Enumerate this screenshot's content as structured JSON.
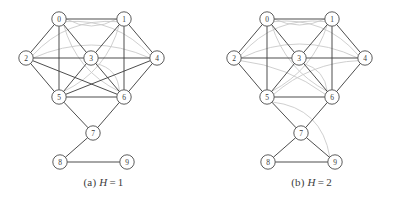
{
  "figure": {
    "panels": [
      {
        "id": "a",
        "caption_tag": "(a)",
        "caption_var": "H",
        "caption_eq": "=",
        "caption_value": "1",
        "nodes": [
          {
            "id": "0",
            "label": "0",
            "x": 59,
            "y": 19
          },
          {
            "id": "1",
            "label": "1",
            "x": 124,
            "y": 19
          },
          {
            "id": "2",
            "label": "2",
            "x": 26,
            "y": 58
          },
          {
            "id": "3",
            "label": "3",
            "x": 91,
            "y": 58
          },
          {
            "id": "4",
            "label": "4",
            "x": 157,
            "y": 58
          },
          {
            "id": "5",
            "label": "5",
            "x": 59,
            "y": 97
          },
          {
            "id": "6",
            "label": "6",
            "x": 124,
            "y": 97
          },
          {
            "id": "7",
            "label": "7",
            "x": 93,
            "y": 133
          },
          {
            "id": "8",
            "label": "8",
            "x": 60,
            "y": 162
          },
          {
            "id": "9",
            "label": "9",
            "x": 127,
            "y": 162
          }
        ],
        "node_radius": 7.2,
        "edges_dark": [
          {
            "from": "0",
            "to": "1"
          },
          {
            "from": "0",
            "to": "2"
          },
          {
            "from": "0",
            "to": "3"
          },
          {
            "from": "0",
            "to": "5"
          },
          {
            "from": "1",
            "to": "3"
          },
          {
            "from": "1",
            "to": "4"
          },
          {
            "from": "1",
            "to": "6"
          },
          {
            "from": "2",
            "to": "3"
          },
          {
            "from": "2",
            "to": "5"
          },
          {
            "from": "2",
            "to": "6"
          },
          {
            "from": "3",
            "to": "4"
          },
          {
            "from": "3",
            "to": "5"
          },
          {
            "from": "3",
            "to": "6"
          },
          {
            "from": "4",
            "to": "5"
          },
          {
            "from": "4",
            "to": "6"
          },
          {
            "from": "5",
            "to": "6"
          },
          {
            "from": "5",
            "to": "7"
          },
          {
            "from": "6",
            "to": "7"
          },
          {
            "from": "7",
            "to": "8"
          },
          {
            "from": "8",
            "to": "9"
          }
        ],
        "edges_light": [
          {
            "from": "0",
            "to": "4",
            "bow": -22
          },
          {
            "from": "0",
            "to": "6",
            "bow": 20
          },
          {
            "from": "1",
            "to": "2",
            "bow": 22
          },
          {
            "from": "1",
            "to": "5",
            "bow": -20
          },
          {
            "from": "2",
            "to": "4",
            "bow": -26
          },
          {
            "from": "3",
            "to": "6",
            "bow": -14
          },
          {
            "from": "0",
            "to": "1",
            "bow": 14
          }
        ]
      },
      {
        "id": "b",
        "caption_tag": "(b)",
        "caption_var": "H",
        "caption_eq": "=",
        "caption_value": "2",
        "nodes": [
          {
            "id": "0",
            "label": "0",
            "x": 59,
            "y": 19
          },
          {
            "id": "1",
            "label": "1",
            "x": 124,
            "y": 19
          },
          {
            "id": "2",
            "label": "2",
            "x": 26,
            "y": 58
          },
          {
            "id": "3",
            "label": "3",
            "x": 91,
            "y": 58
          },
          {
            "id": "4",
            "label": "4",
            "x": 157,
            "y": 58
          },
          {
            "id": "5",
            "label": "5",
            "x": 59,
            "y": 97
          },
          {
            "id": "6",
            "label": "6",
            "x": 124,
            "y": 97
          },
          {
            "id": "7",
            "label": "7",
            "x": 93,
            "y": 133
          },
          {
            "id": "8",
            "label": "8",
            "x": 60,
            "y": 162
          },
          {
            "id": "9",
            "label": "9",
            "x": 127,
            "y": 162
          }
        ],
        "node_radius": 7.2,
        "edges_dark": [
          {
            "from": "0",
            "to": "1"
          },
          {
            "from": "0",
            "to": "2"
          },
          {
            "from": "0",
            "to": "3"
          },
          {
            "from": "0",
            "to": "5"
          },
          {
            "from": "1",
            "to": "3"
          },
          {
            "from": "1",
            "to": "4"
          },
          {
            "from": "1",
            "to": "6"
          },
          {
            "from": "2",
            "to": "3"
          },
          {
            "from": "2",
            "to": "5"
          },
          {
            "from": "3",
            "to": "4"
          },
          {
            "from": "3",
            "to": "5"
          },
          {
            "from": "3",
            "to": "6"
          },
          {
            "from": "4",
            "to": "6"
          },
          {
            "from": "5",
            "to": "6"
          },
          {
            "from": "5",
            "to": "7"
          },
          {
            "from": "6",
            "to": "7"
          },
          {
            "from": "7",
            "to": "8"
          },
          {
            "from": "7",
            "to": "9"
          },
          {
            "from": "8",
            "to": "9"
          }
        ],
        "edges_light": [
          {
            "from": "0",
            "to": "4",
            "bow": -24
          },
          {
            "from": "0",
            "to": "6",
            "bow": 18
          },
          {
            "from": "1",
            "to": "2",
            "bow": 24
          },
          {
            "from": "1",
            "to": "5",
            "bow": -18
          },
          {
            "from": "2",
            "to": "4",
            "bow": -28
          },
          {
            "from": "2",
            "to": "6",
            "bow": -12
          },
          {
            "from": "3",
            "to": "6",
            "bow": -12
          },
          {
            "from": "0",
            "to": "1",
            "bow": 12
          },
          {
            "from": "4",
            "to": "5",
            "bow": 16
          },
          {
            "from": "5",
            "to": "9",
            "bow": -30
          }
        ]
      }
    ]
  }
}
